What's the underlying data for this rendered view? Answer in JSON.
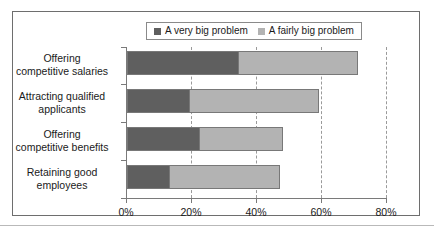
{
  "chart_data": {
    "type": "bar",
    "orientation": "horizontal",
    "stacked": true,
    "title": "",
    "xlabel": "",
    "ylabel": "",
    "xlim": [
      0,
      80
    ],
    "xticks": [
      0,
      20,
      40,
      60,
      80
    ],
    "xtick_labels": [
      "0%",
      "20%",
      "40%",
      "60%",
      "80%"
    ],
    "grid": true,
    "legend_position": "top",
    "categories": [
      "Offering\ncompetitive salaries",
      "Attracting qualified\napplicants",
      "Offering\ncompetitive benefits",
      "Retaining good\nemployees"
    ],
    "series": [
      {
        "name": "A very big problem",
        "color": "#5f5f5f",
        "values": [
          34,
          19,
          22,
          13
        ]
      },
      {
        "name": "A fairly big problem",
        "color": "#b3b3b3",
        "values": [
          37,
          40,
          26,
          34
        ]
      }
    ],
    "totals": [
      71,
      59,
      48,
      47
    ]
  },
  "legend": {
    "items": [
      {
        "label": "A very big problem",
        "swatch": "#5f5f5f"
      },
      {
        "label": "A fairly big problem",
        "swatch": "#b3b3b3"
      }
    ]
  },
  "categories": [
    {
      "line1": "Offering",
      "line2": "competitive salaries"
    },
    {
      "line1": "Attracting qualified",
      "line2": "applicants"
    },
    {
      "line1": "Offering",
      "line2": "competitive benefits"
    },
    {
      "line1": "Retaining good",
      "line2": "employees"
    }
  ],
  "axis": {
    "ticks": [
      {
        "label": "0%",
        "value": 0
      },
      {
        "label": "20%",
        "value": 20
      },
      {
        "label": "40%",
        "value": 40
      },
      {
        "label": "60%",
        "value": 60
      },
      {
        "label": "80%",
        "value": 80
      }
    ]
  },
  "colors": {
    "very_big": "#5f5f5f",
    "fairly_big": "#b3b3b3",
    "frame": "#6e6e6e",
    "axis": "#7a7a7a",
    "grid": "#9a9a9a",
    "text": "#1a1a1a"
  }
}
